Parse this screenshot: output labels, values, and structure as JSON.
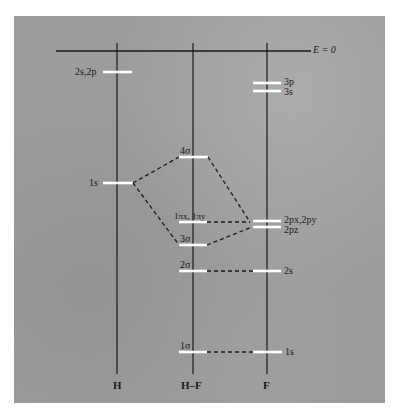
{
  "diagram": {
    "energy_zero_label": "E = 0",
    "columns": [
      {
        "id": "H",
        "label": "H"
      },
      {
        "id": "HF",
        "label": "H–F"
      },
      {
        "id": "F",
        "label": "F"
      }
    ],
    "levels": {
      "H": [
        {
          "label": "2s,2p"
        },
        {
          "label": "1s"
        }
      ],
      "HF": [
        {
          "label": "4σ"
        },
        {
          "label": "1πx, 1πy"
        },
        {
          "label": "3σ"
        },
        {
          "label": "2σ"
        },
        {
          "label": "1σ"
        }
      ],
      "F": [
        {
          "label": "3p"
        },
        {
          "label": "3s"
        },
        {
          "label": "2px,2py"
        },
        {
          "label": "2pz"
        },
        {
          "label": "2s"
        },
        {
          "label": "1s"
        }
      ]
    },
    "colors": {
      "background": "#9c9c9c",
      "level_bar": "#ffffff",
      "lines": "#1a1a1a"
    }
  }
}
